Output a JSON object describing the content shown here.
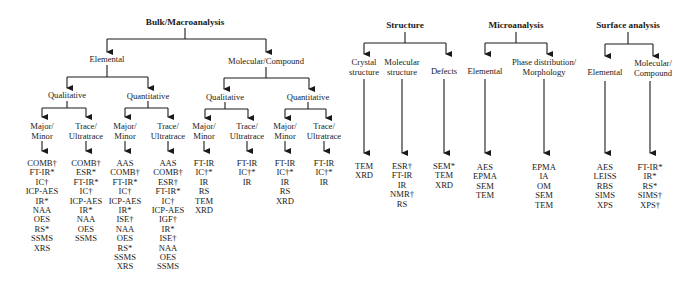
{
  "bulk": {
    "title": "Bulk/Macroanalysis",
    "elemental": {
      "label": "Elemental",
      "qualitative": {
        "label": "Qualitative",
        "major_minor": {
          "label1": "Major/",
          "label2": "Minor",
          "techniques": [
            "COMB†",
            "FT-IR*",
            "IC†",
            "ICP-AES",
            "IR*",
            "NAA",
            "OES",
            "RS*",
            "SSMS",
            "XRS"
          ]
        },
        "trace": {
          "label1": "Trace/",
          "label2": "Ultratrace",
          "techniques": [
            "COMB†",
            "ESR*",
            "FT-IR*",
            "IC†",
            "ICP-AES",
            "IR*",
            "NAA",
            "OES",
            "SSMS"
          ]
        }
      },
      "quantitative": {
        "label": "Quantitative",
        "major_minor": {
          "label1": "Major/",
          "label2": "Minor",
          "techniques": [
            "AAS",
            "COMB†",
            "FT-IR*",
            "IC†",
            "ICP-AES",
            "IR*",
            "ISE†",
            "NAA",
            "OES",
            "RS*",
            "SSMS",
            "XRS"
          ]
        },
        "trace": {
          "label1": "Trace/",
          "label2": "Ultratrace",
          "techniques": [
            "AAS",
            "COMB†",
            "ESR†",
            "FT-IR*",
            "IC†",
            "ICP-AES",
            "IGF†",
            "IR*",
            "ISE†",
            "NAA",
            "OES",
            "SSMS"
          ]
        }
      }
    },
    "molecular": {
      "label": "Molecular/Compound",
      "qualitative": {
        "label": "Qualitative",
        "major_minor": {
          "label1": "Major/",
          "label2": "Minor",
          "techniques": [
            "FT-IR",
            "IC†*",
            "IR",
            "RS",
            "TEM",
            "XRD"
          ]
        },
        "trace": {
          "label1": "Trace/",
          "label2": "Ultratrace",
          "techniques": [
            "FT-IR",
            "IC†*",
            "IR"
          ]
        }
      },
      "quantitative": {
        "label": "Quantitative",
        "major_minor": {
          "label1": "Major/",
          "label2": "Minor",
          "techniques": [
            "FT-IR",
            "IC†*",
            "IR",
            "RS",
            "XRD"
          ]
        },
        "trace": {
          "label1": "Trace/",
          "label2": "Ultratrace",
          "techniques": [
            "FT-IR",
            "IC†*",
            "IR"
          ]
        }
      }
    }
  },
  "structure": {
    "title": "Structure",
    "crystal": {
      "label1": "Crystal",
      "label2": "structure",
      "techniques": [
        "TEM",
        "XRD"
      ]
    },
    "molecular": {
      "label1": "Molecular",
      "label2": "structure",
      "techniques": [
        "ESR†",
        "FT-IR",
        "IR",
        "NMR†",
        "RS"
      ]
    },
    "defects": {
      "label": "Defects",
      "techniques": [
        "SEM*",
        "TEM",
        "XRD"
      ]
    }
  },
  "micro": {
    "title": "Microanalysis",
    "elemental": {
      "label": "Elemental",
      "techniques": [
        "AES",
        "EPMA",
        "SEM",
        "TEM"
      ]
    },
    "phase": {
      "label1": "Phase distribution/",
      "label2": "Morphology",
      "techniques": [
        "EPMA",
        "IA",
        "OM",
        "SEM",
        "TEM"
      ]
    }
  },
  "surface": {
    "title": "Surface analysis",
    "elemental": {
      "label": "Elemental",
      "techniques": [
        "AES",
        "LEISS",
        "RBS",
        "SIMS",
        "XPS"
      ]
    },
    "molecular": {
      "label1": "Molecular/",
      "label2": "Compound",
      "techniques": [
        "FT-IR*",
        "IR*",
        "RS*",
        "SIMS†",
        "XPS†"
      ]
    }
  }
}
